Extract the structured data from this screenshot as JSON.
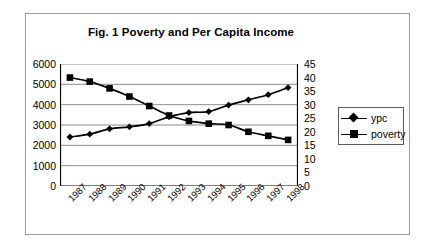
{
  "chart_data": {
    "type": "line",
    "title": "Fig. 1 Poverty and Per Capita Income",
    "xlabel": "",
    "ylabel": "",
    "grid": true,
    "legend_position": "right",
    "categories": [
      "1987",
      "1988",
      "1989",
      "1990",
      "1991",
      "1992",
      "1993",
      "1994",
      "1995",
      "1996",
      "1997",
      "1998"
    ],
    "axes": {
      "left": {
        "label": "",
        "min": 0,
        "max": 6000,
        "step": 1000,
        "ticks": [
          "6000",
          "5000",
          "4000",
          "3000",
          "2000",
          "1000",
          "0"
        ]
      },
      "right": {
        "label": "",
        "min": 0,
        "max": 45,
        "step": 5,
        "ticks": [
          "45",
          "40",
          "35",
          "30",
          "25",
          "20",
          "15",
          "10",
          "5",
          "0"
        ]
      }
    },
    "series": [
      {
        "name": "ypc",
        "axis": "left",
        "marker": "diamond",
        "color": "#000000",
        "values": [
          2410,
          2550,
          2810,
          2910,
          3070,
          3400,
          3610,
          3660,
          3980,
          4240,
          4490,
          4840
        ]
      },
      {
        "name": "poverty",
        "axis": "right",
        "marker": "square",
        "color": "#000000",
        "values": [
          40.0,
          38.5,
          36.0,
          33.0,
          29.5,
          26.0,
          24.0,
          23.0,
          22.5,
          20.0,
          18.5,
          17.0
        ]
      }
    ]
  },
  "legend": {
    "items": [
      {
        "label": "ypc",
        "marker": "diamond"
      },
      {
        "label": "poverty",
        "marker": "square"
      }
    ]
  }
}
